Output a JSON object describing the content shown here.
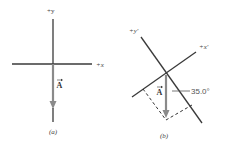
{
  "panel_a": {
    "y_axis_label": "+y",
    "x_axis_label": "+x",
    "vector_label": "A",
    "caption": "(a)"
  },
  "panel_b": {
    "y_axis_label": "+y′",
    "x_axis_label": "+x′",
    "vector_label": "A",
    "angle_label": "35.0°",
    "caption": "(b)"
  },
  "colors": {
    "axis": "#3a3a3a",
    "vector": "#8a8a8a",
    "dashed": "#333333"
  }
}
